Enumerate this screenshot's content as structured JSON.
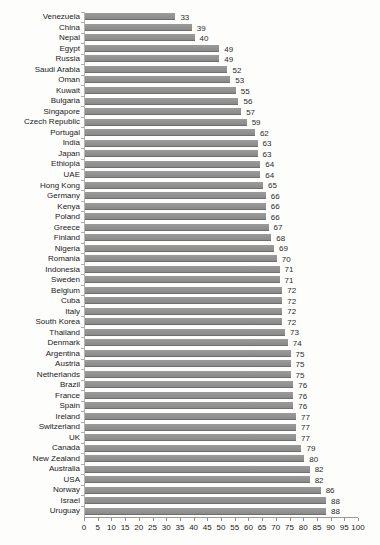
{
  "chart_data": {
    "type": "bar",
    "orientation": "horizontal",
    "title": "",
    "xlabel": "",
    "ylabel": "",
    "xlim": [
      0,
      100
    ],
    "x_ticks": [
      0,
      5,
      10,
      15,
      20,
      25,
      30,
      35,
      40,
      45,
      50,
      55,
      60,
      65,
      70,
      75,
      80,
      85,
      90,
      95,
      100
    ],
    "grid": false,
    "legend": "none",
    "value_labels_shown": true,
    "bar_color": "#8d8d8d",
    "categories": [
      "Venezuela",
      "China",
      "Nepal",
      "Egypt",
      "Russia",
      "Saudi Arabia",
      "Oman",
      "Kuwait",
      "Bulgaria",
      "Singapore",
      "Czech Republic",
      "Portugal",
      "India",
      "Japan",
      "Ethiopia",
      "UAE",
      "Hong Kong",
      "Germany",
      "Kenya",
      "Poland",
      "Greece",
      "Finland",
      "Nigeria",
      "Romania",
      "Indonesia",
      "Sweden",
      "Belgium",
      "Cuba",
      "Italy",
      "South Korea",
      "Thailand",
      "Denmark",
      "Argentina",
      "Austria",
      "Netherlands",
      "Brazil",
      "France",
      "Spain",
      "Ireland",
      "Switzerland",
      "UK",
      "Canada",
      "New Zealand",
      "Australia",
      "USA",
      "Norway",
      "Israel",
      "Uruguay"
    ],
    "values": [
      33,
      39,
      40,
      49,
      49,
      52,
      53,
      55,
      56,
      57,
      59,
      62,
      63,
      63,
      64,
      64,
      65,
      66,
      66,
      66,
      67,
      68,
      69,
      70,
      71,
      71,
      72,
      72,
      72,
      72,
      73,
      74,
      75,
      75,
      75,
      76,
      76,
      76,
      77,
      77,
      77,
      79,
      80,
      82,
      82,
      86,
      88,
      88
    ]
  }
}
